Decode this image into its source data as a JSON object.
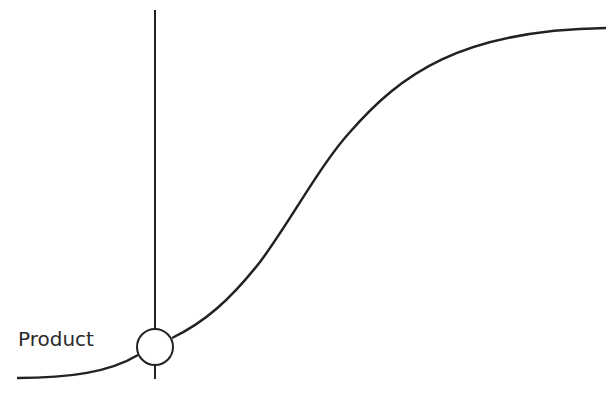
{
  "diagram": {
    "type": "s-curve",
    "stroke_color": "#222222",
    "marker_label": "Product",
    "curve_points": [
      [
        17,
        378
      ],
      [
        155,
        347
      ],
      [
        220,
        305
      ],
      [
        300,
        200
      ],
      [
        380,
        107
      ],
      [
        420,
        80
      ],
      [
        606,
        28
      ]
    ],
    "vertical_line": {
      "x": 155,
      "y1": 10,
      "y2": 378
    },
    "marker": {
      "cx": 155,
      "cy": 347,
      "r": 18
    }
  }
}
